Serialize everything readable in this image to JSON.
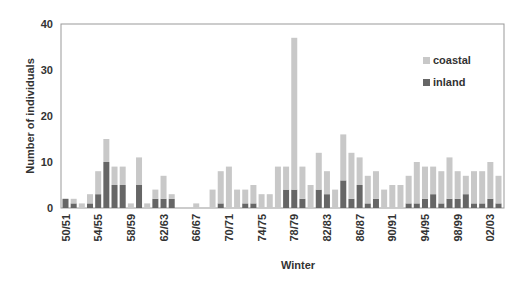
{
  "chart_data": {
    "type": "bar",
    "stacked": true,
    "title": "",
    "xlabel": "Winter",
    "ylabel": "Number of individuals",
    "ylim": [
      0,
      40
    ],
    "yticks": [
      0,
      10,
      20,
      30,
      40
    ],
    "grid": false,
    "legend_position": "upper right (inside)",
    "categories": [
      "50/51",
      "51/52",
      "52/53",
      "53/54",
      "54/55",
      "55/56",
      "56/57",
      "57/58",
      "58/59",
      "59/60",
      "60/61",
      "61/62",
      "62/63",
      "63/64",
      "64/65",
      "65/66",
      "66/67",
      "67/68",
      "68/69",
      "69/70",
      "70/71",
      "71/72",
      "72/73",
      "73/74",
      "74/75",
      "75/76",
      "76/77",
      "77/78",
      "78/79",
      "79/80",
      "80/81",
      "81/82",
      "82/83",
      "83/84",
      "84/85",
      "85/86",
      "86/87",
      "87/88",
      "88/89",
      "89/90",
      "90/91",
      "91/92",
      "92/93",
      "93/94",
      "94/95",
      "95/96",
      "96/97",
      "97/98",
      "98/99",
      "99/00",
      "00/01",
      "01/02",
      "02/03",
      "03/04"
    ],
    "xtick_labels": [
      "50/51",
      "54/55",
      "58/59",
      "62/63",
      "66/67",
      "70/71",
      "74/75",
      "78/79",
      "82/83",
      "86/87",
      "90/91",
      "94/95",
      "98/99",
      "02/03"
    ],
    "series": [
      {
        "name": "inland",
        "color": "#666666",
        "values": [
          2,
          1,
          0,
          1,
          3,
          10,
          5,
          5,
          0,
          5,
          0,
          2,
          2,
          2,
          0,
          0,
          0,
          0,
          0,
          1,
          0,
          0,
          1,
          1,
          0,
          0,
          0,
          4,
          4,
          2,
          0,
          4,
          3,
          0,
          6,
          2,
          5,
          1,
          2,
          0,
          0,
          0,
          1,
          1,
          2,
          3,
          1,
          2,
          2,
          3,
          1,
          1,
          2,
          1
        ]
      },
      {
        "name": "coastal",
        "color": "#c8c8c8",
        "values": [
          0,
          1,
          1,
          2,
          5,
          5,
          4,
          4,
          1,
          6,
          1,
          2,
          5,
          1,
          0,
          0,
          1,
          0,
          4,
          7,
          9,
          4,
          3,
          4,
          3,
          3,
          9,
          5,
          33,
          7,
          5,
          8,
          5,
          4,
          10,
          10,
          6,
          6,
          6,
          4,
          5,
          5,
          6,
          9,
          7,
          6,
          7,
          9,
          6,
          4,
          7,
          7,
          8,
          6
        ]
      }
    ],
    "totals": [
      2,
      2,
      1,
      3,
      8,
      15,
      9,
      9,
      1,
      11,
      1,
      4,
      7,
      3,
      0,
      0,
      1,
      0,
      4,
      8,
      9,
      4,
      4,
      5,
      3,
      3,
      9,
      9,
      37,
      9,
      5,
      12,
      8,
      4,
      16,
      12,
      11,
      7,
      8,
      4,
      5,
      5,
      7,
      10,
      9,
      9,
      8,
      11,
      8,
      7,
      8,
      8,
      10,
      7
    ]
  },
  "legend": {
    "items": [
      {
        "label": "coastal",
        "color": "#c8c8c8"
      },
      {
        "label": "inland",
        "color": "#666666"
      }
    ]
  },
  "axes": {
    "x_title": "Winter",
    "y_title": "Number of individuals"
  }
}
